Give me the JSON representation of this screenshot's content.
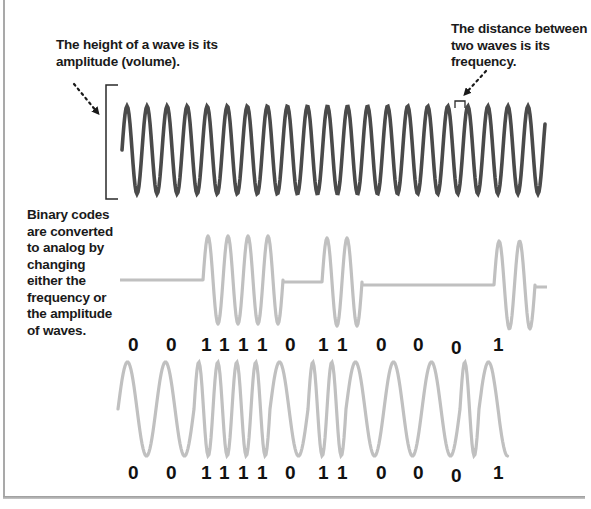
{
  "captions": {
    "amplitude": "The height of a wave is its amplitude (volume).",
    "frequency": "The distance between two waves is its frequency.",
    "binary": "Binary codes are converted to analog by changing either the frequency or the amplitude of waves."
  },
  "colors": {
    "carrier_wave": "#4a4a4a",
    "modulated_wave": "#c0c0c0",
    "frame": "#a9a9a9",
    "text": "#1a1a1a"
  },
  "binary_sequence": {
    "bits": [
      "0",
      "0",
      "1",
      "1",
      "1",
      "1",
      "0",
      "1",
      "1",
      "0",
      "0",
      "0",
      "1"
    ],
    "upper_label_x": [
      128,
      166,
      201,
      219,
      238,
      257,
      285,
      318,
      337,
      376,
      413,
      451,
      493
    ],
    "lower_label_x": [
      128,
      166,
      201,
      219,
      238,
      257,
      285,
      318,
      337,
      376,
      413,
      451,
      493
    ]
  },
  "waves": {
    "carrier": {
      "label": "analog carrier wave",
      "cycles": 21
    },
    "amplitude_modulated": {
      "label": "amplitude-modulated binary signal",
      "bursts": [
        4,
        2,
        2
      ]
    },
    "frequency_modulated": {
      "label": "frequency-modulated binary signal"
    }
  }
}
